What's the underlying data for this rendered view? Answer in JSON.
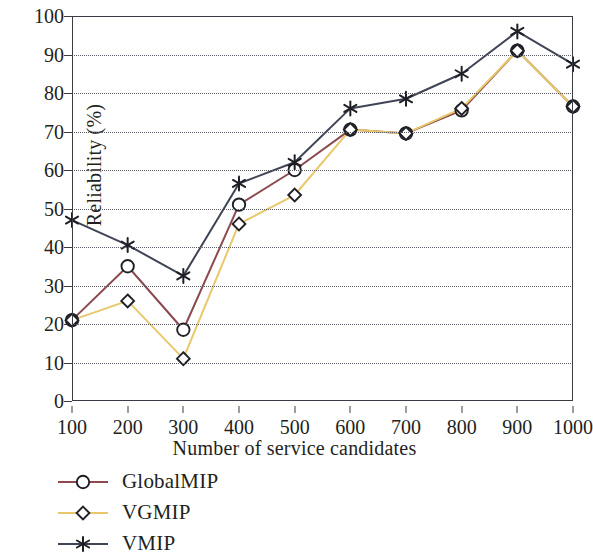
{
  "chart_data": {
    "type": "line",
    "title": "",
    "xlabel": "Number of service candidates",
    "ylabel": "Reliability (%)",
    "x": [
      100,
      200,
      300,
      400,
      500,
      600,
      700,
      800,
      900,
      1000
    ],
    "xtick_labels": [
      "100",
      "200",
      "300",
      "400",
      "500",
      "600",
      "700",
      "800",
      "900",
      "1000"
    ],
    "ytick_labels": [
      "0",
      "10",
      "20",
      "30",
      "40",
      "50",
      "60",
      "70",
      "80",
      "90",
      "100"
    ],
    "yticks": [
      0,
      10,
      20,
      30,
      40,
      50,
      60,
      70,
      80,
      90,
      100
    ],
    "xlim": [
      100,
      1000
    ],
    "ylim": [
      0,
      100
    ],
    "grid": "horizontal-dotted",
    "legend_position": "below-left",
    "series": [
      {
        "name": "GlobalMIP",
        "color": "#8c4a4f",
        "marker": "circle",
        "values": [
          21,
          35,
          18.5,
          51,
          60,
          70.5,
          69.5,
          75.5,
          91,
          76.5
        ]
      },
      {
        "name": "VGMIP",
        "color": "#e8c86a",
        "marker": "diamond",
        "values": [
          21,
          26,
          11,
          46,
          53.5,
          70.5,
          69.5,
          76,
          91,
          76.5
        ]
      },
      {
        "name": "VMIP",
        "color": "#3f4456",
        "marker": "asterisk",
        "values": [
          47,
          40.5,
          32.5,
          56.5,
          62,
          76,
          78.5,
          85,
          96,
          87.5
        ]
      }
    ]
  },
  "legend": {
    "items": [
      {
        "label": "GlobalMIP"
      },
      {
        "label": "VGMIP"
      },
      {
        "label": "VMIP"
      }
    ]
  },
  "axes": {
    "frame_color": "#3b3b44",
    "grid_color": "#5c5c66"
  }
}
